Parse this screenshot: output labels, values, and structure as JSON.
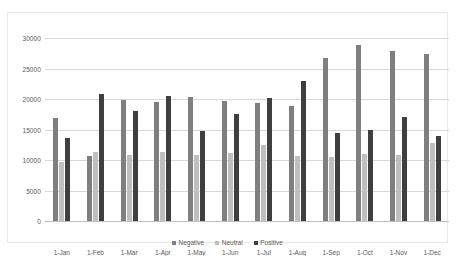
{
  "chart_data": {
    "type": "bar",
    "title": "",
    "xlabel": "",
    "ylabel": "",
    "ylim": [
      0,
      30000
    ],
    "ytick_values": [
      0,
      5000,
      10000,
      15000,
      20000,
      25000,
      30000
    ],
    "ytick_labels": [
      "0",
      "5000",
      "10000",
      "15000",
      "20000",
      "25000",
      "30000"
    ],
    "grid": true,
    "legend_position": "bottom",
    "categories": [
      "1-Jan",
      "1-Feb",
      "1-Mar",
      "1-Apr",
      "1-May",
      "1-Jun",
      "1-Jul",
      "1-Aug",
      "1-Sep",
      "1-Oct",
      "1-Nov",
      "1-Dec"
    ],
    "series": [
      {
        "name": "Negative",
        "color": "#7f7f7f",
        "values": [
          16900,
          10700,
          19800,
          19500,
          20400,
          19600,
          19300,
          18900,
          26800,
          28900,
          27900,
          27300
        ]
      },
      {
        "name": "Neutral",
        "color": "#bfbfbf",
        "values": [
          9600,
          11300,
          10800,
          11300,
          10800,
          11200,
          12500,
          10600,
          10500,
          11000,
          10900,
          12800
        ]
      },
      {
        "name": "Positive",
        "color": "#3f3f3f",
        "values": [
          13600,
          20900,
          18100,
          20500,
          14800,
          17500,
          20200,
          23000,
          14400,
          14900,
          17000,
          14000
        ]
      }
    ]
  }
}
